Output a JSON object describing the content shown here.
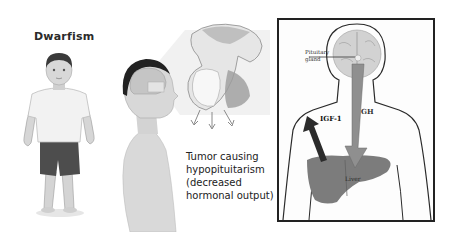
{
  "panels": {
    "child": {
      "title": "Dwarfism"
    },
    "tumor": {
      "caption_lines": [
        "Tumor causing",
        "hypopituitarism",
        "(decreased",
        "hormonal output)"
      ]
    },
    "diagram": {
      "pituitary_label_lines": [
        "Pituitary",
        "gland"
      ],
      "gh_label": "GH",
      "igf_label": "IGF-1",
      "liver_label": "Liver"
    }
  },
  "colors": {
    "background": "#ffffff",
    "frame": "#222222",
    "outline": "#2a2a2a",
    "liver": "#7c7c7c",
    "gh_arrow": "#8f8f8f",
    "igf_arrow": "#2b2b2b",
    "brain": "#cfcfcf",
    "shirt": "#f2f2f2",
    "shorts": "#4d4d4d",
    "skin": "#d6d6d6"
  }
}
